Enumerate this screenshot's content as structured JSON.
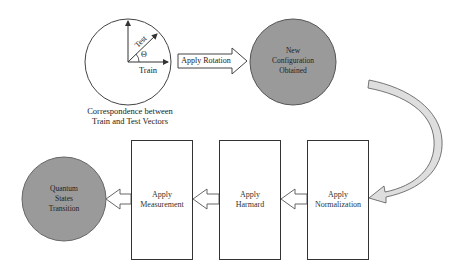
{
  "diagram": {
    "colors": {
      "line": "#333333",
      "gray_node": "#9a9a9a",
      "gray_node_border": "#555555",
      "curved_arrow_fill": "#dedede",
      "background": "#ffffff"
    },
    "vector_circle": {
      "train_label": "Train",
      "test_label": "Test",
      "angle_label": "Θ",
      "caption_line1": "Correspondence between",
      "caption_line2": "Train and Test Vectors"
    },
    "rotation_arrow": {
      "label": "Apply Rotation"
    },
    "new_config_node": {
      "line1": "New",
      "line2": "Configuration",
      "line3": "Obtained"
    },
    "steps": [
      {
        "line1": "Apply",
        "line2": "Normalization"
      },
      {
        "line1": "Apply",
        "line2": "Harmard"
      },
      {
        "line1": "Apply",
        "line2": "Measurement"
      }
    ],
    "final_node": {
      "line1": "Quantum",
      "line2": "States",
      "line3": "Transition"
    }
  }
}
